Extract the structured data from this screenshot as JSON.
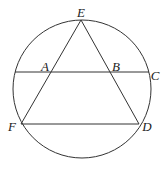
{
  "diagram": {
    "type": "geometry",
    "stroke_color": "#333333",
    "circle": {
      "cx": 82,
      "cy": 89,
      "r": 69
    },
    "points": {
      "E": {
        "x": 81,
        "y": 20
      },
      "F": {
        "x": 21,
        "y": 124
      },
      "D": {
        "x": 139,
        "y": 124
      },
      "A": {
        "x": 50,
        "y": 72
      },
      "B": {
        "x": 111,
        "y": 72
      },
      "C": {
        "x": 149,
        "y": 72
      },
      "L": {
        "x": 15,
        "y": 72
      }
    },
    "segments": [
      {
        "from": "E",
        "to": "F"
      },
      {
        "from": "E",
        "to": "D"
      },
      {
        "from": "F",
        "to": "D"
      },
      {
        "from": "L",
        "to": "C"
      }
    ],
    "labels": {
      "E": {
        "text": "E",
        "x": 81,
        "y": 12
      },
      "A": {
        "text": "A",
        "x": 45,
        "y": 66
      },
      "B": {
        "text": "B",
        "x": 116,
        "y": 66
      },
      "C": {
        "text": "C",
        "x": 155,
        "y": 75
      },
      "F": {
        "text": "F",
        "x": 12,
        "y": 126
      },
      "D": {
        "text": "D",
        "x": 147,
        "y": 126
      }
    }
  }
}
